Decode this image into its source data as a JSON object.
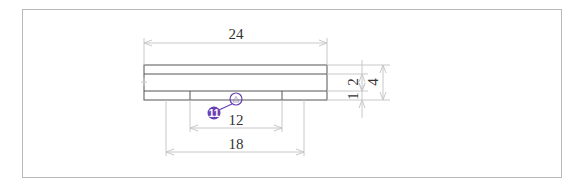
{
  "drawing": {
    "title": "Part cross-section with dimensions",
    "colors": {
      "frame": "#b8b8b8",
      "outline": "#555555",
      "dimension": "#c8c8c8",
      "text": "#333333",
      "balloon": "#6a3fb5"
    },
    "dimensions": {
      "overall_width": "24",
      "slot_width": "12",
      "outer_step_width": "18",
      "upper_layer_height": "2",
      "lower_layer_height": "1",
      "total_height": "4"
    },
    "balloon": {
      "label": "11",
      "symbol": "triangle"
    }
  }
}
